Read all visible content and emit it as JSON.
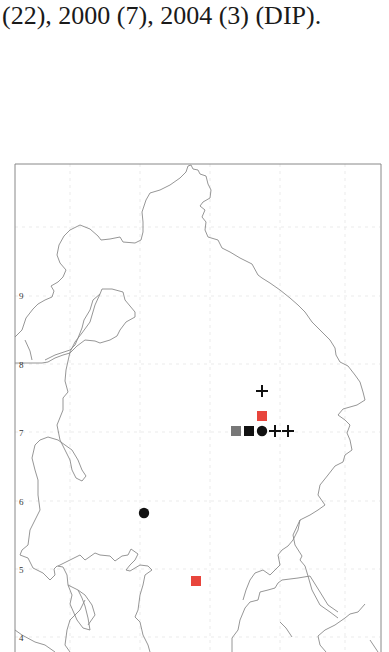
{
  "caption": {
    "line_cut": "(   )       (   )       (   )      (   ),",
    "line": "(22), 2000 (7), 2004 (3) (DIP)."
  },
  "map": {
    "frame_color": "#888888",
    "coast_color": "#8a8a8a",
    "y_axis_labels": [
      {
        "label": "9",
        "y": 295
      },
      {
        "label": "8",
        "y": 364
      },
      {
        "label": "7",
        "y": 432
      },
      {
        "label": "6",
        "y": 501
      },
      {
        "label": "5",
        "y": 569
      },
      {
        "label": "4",
        "y": 637
      }
    ],
    "markers": [
      {
        "shape": "plus",
        "color": "#111111",
        "x": 262,
        "y": 391
      },
      {
        "shape": "square",
        "color": "#e8453c",
        "x": 262,
        "y": 417
      },
      {
        "shape": "square",
        "color": "#777777",
        "x": 236,
        "y": 431
      },
      {
        "shape": "square",
        "color": "#111111",
        "x": 249,
        "y": 431
      },
      {
        "shape": "circle",
        "color": "#111111",
        "x": 262,
        "y": 431
      },
      {
        "shape": "plus",
        "color": "#111111",
        "x": 275,
        "y": 431
      },
      {
        "shape": "plus",
        "color": "#111111",
        "x": 288,
        "y": 431
      },
      {
        "shape": "circle",
        "color": "#111111",
        "x": 144,
        "y": 513
      },
      {
        "shape": "square",
        "color": "#e8453c",
        "x": 196,
        "y": 581
      }
    ]
  }
}
